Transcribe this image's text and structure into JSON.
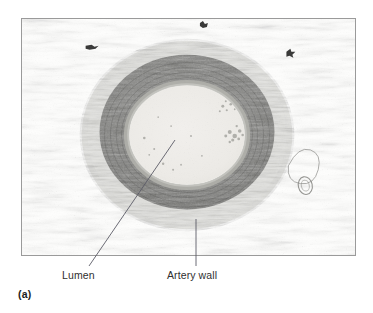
{
  "figure": {
    "panel_letter": "(a)",
    "labels": [
      {
        "id": "lumen",
        "text": "Lumen"
      },
      {
        "id": "artery-wall",
        "text": "Artery wall"
      }
    ],
    "colors": {
      "background": "#ffffff",
      "frame_border": "#9a9a9a",
      "field_background": "#fdfdfc",
      "adventitia": "#d8d8d5",
      "media_dark": "#6e6e6c",
      "media_darker": "#5a5a58",
      "intima": "#b4b4b0",
      "lumen": "#eceae6",
      "label_text": "#2f2f2f",
      "leader_line": "#5b5b66"
    },
    "geometry": {
      "frame": {
        "x": 21,
        "y": 18,
        "width": 335,
        "height": 238
      },
      "vessel_center": {
        "x": 187,
        "y": 135
      },
      "outer_wall_radius": {
        "rx": 88,
        "ry": 78
      },
      "lumen_radius": {
        "rx": 58,
        "ry": 50
      }
    },
    "leaders": [
      {
        "id": "lumen",
        "x1": 175,
        "y1": 140,
        "x2": 89,
        "y2": 266
      },
      {
        "id": "artery-wall",
        "x1": 196,
        "y1": 219,
        "x2": 196,
        "y2": 266
      }
    ]
  }
}
